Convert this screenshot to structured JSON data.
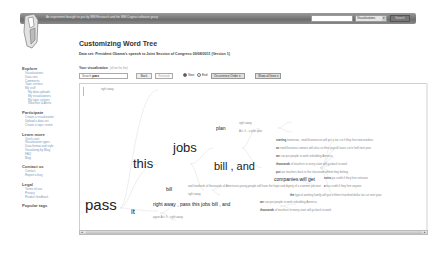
{
  "header": {
    "tagline": "An experiment brought to you by IBM Research and the IBM Cognos software group",
    "search": {
      "value": "",
      "placeholder": ""
    },
    "scope_select": "Visualizations",
    "search_button": "Search"
  },
  "sidebar": {
    "sections": [
      {
        "title": "Explore",
        "items": [
          "Visualizations",
          "Data sets",
          "Comments",
          "Topic centers",
          "My stuff"
        ],
        "subitems": [
          "My data uploads",
          "My visualizations",
          "My topic centers",
          "Watchlist & Alerts"
        ]
      },
      {
        "title": "Participate",
        "items": [
          "Create a visualization",
          "Upload a data set",
          "Create a topic center"
        ]
      },
      {
        "title": "Learn more",
        "items": [
          "Quick start",
          "Visualization types",
          "Data format and style",
          "Visualizing by Blog",
          "FAQ",
          "Blog"
        ]
      },
      {
        "title": "Contact us",
        "items": [
          "Contact",
          "Report a bug"
        ]
      },
      {
        "title": "Legal",
        "items": [
          "Terms of use",
          "Privacy",
          "Product feedback"
        ]
      },
      {
        "title": "Popular tags",
        "items": []
      }
    ]
  },
  "main": {
    "title": "Customizing Word Tree",
    "subtitle": "Data set: President Obama's speech to Joint Session of Congress 09/08/2011 (Version 1)",
    "viz_label": "Your visualization",
    "viz_hint": "(all text fits fine)",
    "controls": {
      "search_label": "Search",
      "search_value": "pass",
      "back_button": "Back",
      "forward_button": "Forward",
      "radio_start": "Start",
      "radio_end": "End",
      "order_select": "Occurrence Order",
      "fit_select": "Show all lines"
    }
  },
  "word_tree": {
    "root": "pass",
    "branches": {
      "top_small": "right away",
      "this": "this",
      "jobs": "jobs",
      "plan": "plan",
      "plan_right": "right away",
      "plan_act": "Act. It - a jobs plan",
      "bill_and": "bill , and",
      "companies": "companies will get",
      "bill": "bill",
      "bill_right": "right away",
      "bill_tail": "and hundreds of thousands of Americans young people will have the hope and dignity of a summer job next",
      "it": "it",
      "it_right": "right away , pass this jobs bill , and",
      "it_again": "again Act. It - right away"
    },
    "leaves": [
      {
        "lead": "starting",
        "text": "tomorrow , small businesses will get a tax cut if they hire new workers"
      },
      {
        "lead": "an",
        "text": "small business owners will also cut their payroll taxes cut in half next year"
      },
      {
        "lead": "we",
        "text": "can put people to work rebuilding America"
      },
      {
        "lead": "thousands",
        "text": "of teachers in every state will go back to work"
      },
      {
        "lead": "put",
        "text": "our teachers back in the classroom where they belong"
      },
      {
        "lead": "extra",
        "text": "tax credit if they hire veterans"
      },
      {
        "lead": "a",
        "text": "tax credit if they hire anyone"
      },
      {
        "lead": "the",
        "text": "typical working family will get a fifteen hundred dollar tax cut next year"
      }
    ],
    "it_leaves": [
      {
        "lead": "we",
        "text": "can put people to work rebuilding America"
      },
      {
        "lead": "thousands",
        "text": "of teachers in every state will go back to work"
      }
    ]
  }
}
